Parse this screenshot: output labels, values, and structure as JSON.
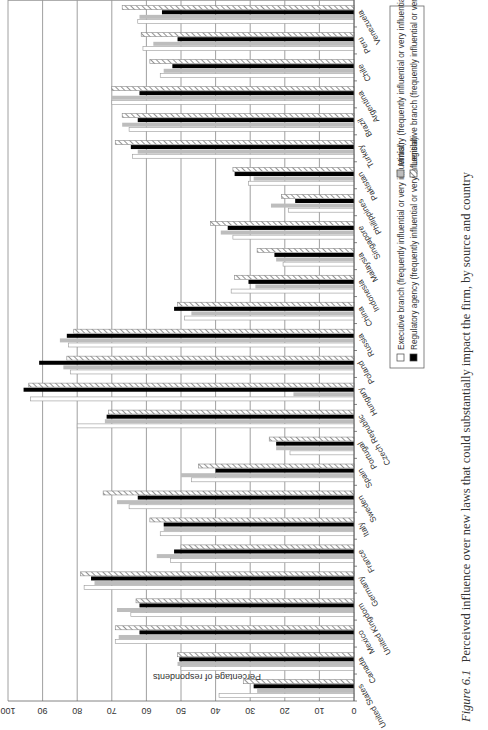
{
  "chart_data": {
    "type": "bar",
    "orientation": "vertical bars (figure rotated 90 degrees counter-clockwise on page)",
    "title": "Figure 6.1 Perceived influence over new laws that could substantially impact the firm, by source and country",
    "caption_label": "Figure 6.1",
    "caption_text": "Perceived influence over new laws that could substantially impact the firm, by source and country",
    "xlabel": "",
    "ylabel": "Percentage of respondents",
    "ylim": [
      0,
      100
    ],
    "yticks": [
      0,
      10,
      20,
      30,
      40,
      50,
      60,
      70,
      80,
      90,
      100
    ],
    "grid": true,
    "legend_position": "bottom-right (boxed)",
    "categories": [
      "United States",
      "Canada",
      "Mexico",
      "United Kingdom",
      "Germany",
      "France",
      "Italy",
      "Sweden",
      "Spain",
      "Portugal",
      "Czech Republic",
      "Hungary",
      "Poland",
      "Russia",
      "China",
      "Indonesia",
      "Malaysia",
      "Singapore",
      "Philippines",
      "Pakistan",
      "Turkey",
      "Brazil",
      "Argentina",
      "Chile",
      "Peru",
      "Venezuela"
    ],
    "series": [
      {
        "name": "Executive branch (frequently influential or very influential)",
        "pattern": "white",
        "values": [
          39,
          50,
          69,
          64.5,
          78,
          53,
          56,
          65,
          47,
          18.5,
          80,
          93.5,
          82,
          82.5,
          49,
          35.5,
          20.5,
          35,
          19,
          30.5,
          64,
          65,
          70,
          56,
          61,
          62.5
        ]
      },
      {
        "name": "Ministry (frequently influential or very influential)",
        "pattern": "gray",
        "values": [
          28,
          51,
          68,
          68.5,
          75,
          57,
          55,
          68.5,
          50,
          22.5,
          72,
          17.5,
          84,
          85,
          47,
          28.5,
          22.5,
          38.5,
          24,
          29,
          62.5,
          67,
          70,
          55,
          58,
          62
        ]
      },
      {
        "name": "Regulatory agency (frequently influential or very influential)",
        "pattern": "black",
        "values": [
          29,
          50.5,
          62,
          62,
          76,
          52,
          55,
          62.5,
          40,
          22.5,
          71.5,
          95.5,
          91,
          83,
          52,
          30.5,
          23,
          36.5,
          17,
          34.5,
          64.5,
          62.5,
          62,
          52.5,
          51,
          55.5
        ]
      },
      {
        "name": "Legislative branch (frequently influential or very influential)",
        "pattern": "hatched",
        "values": [
          32,
          51,
          69,
          63,
          79,
          50,
          59,
          72.5,
          45,
          24.5,
          71,
          94,
          83,
          81,
          51,
          34.5,
          28,
          41.5,
          21,
          35,
          69,
          67,
          70,
          59,
          61.5,
          67
        ]
      }
    ]
  },
  "legend": {
    "items": [
      {
        "label": "Executive branch (frequently influential or very influential)",
        "pattern": "white"
      },
      {
        "label": "Regulatory agency (frequently influential or very influential)",
        "pattern": "black"
      },
      {
        "label": "Ministry (frequently influential or very influential)",
        "pattern": "gray"
      },
      {
        "label": "Legislative branch (frequently influential or very influential)",
        "pattern": "hatched"
      }
    ]
  },
  "colors": {
    "executive": "#ffffff",
    "ministry": "#bdbdbd",
    "regulatory": "#000000",
    "legislative_stripe": "#777777",
    "grid": "#777777"
  }
}
